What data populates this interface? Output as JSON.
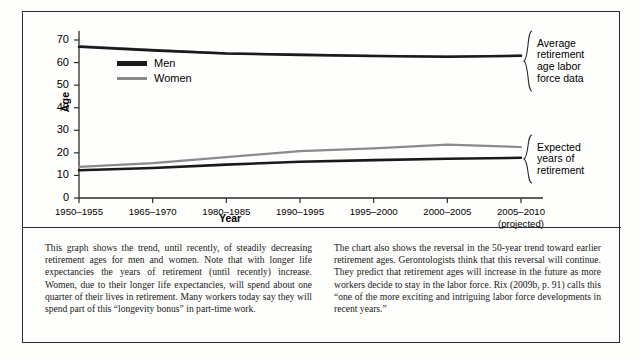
{
  "chart_data": {
    "type": "line",
    "title": "",
    "xlabel": "Year",
    "ylabel": "Age",
    "ylim": [
      0,
      70
    ],
    "ytick_step": 10,
    "grid": false,
    "legend_position": "upper-left-inside",
    "categories": [
      "1950–1955",
      "1965–1970",
      "1980–1985",
      "1990–1995",
      "1995–2000",
      "2000–2005",
      "2005–2010"
    ],
    "category_sublabels": [
      "",
      "",
      "",
      "",
      "",
      "",
      "(projected)"
    ],
    "yticks": [
      0,
      10,
      20,
      30,
      40,
      50,
      60,
      70
    ],
    "series": [
      {
        "name": "Men",
        "group": "Average retirement age labor force data",
        "color": "#1a1a1a",
        "values": [
          67.0,
          65.4,
          64.0,
          63.4,
          62.9,
          62.6,
          63.0
        ]
      },
      {
        "name": "Women",
        "group": "Average retirement age labor force data",
        "color": "#8a8a8a",
        "values": [
          67.3,
          65.6,
          64.1,
          63.5,
          63.0,
          62.7,
          63.1
        ]
      },
      {
        "name": "Men",
        "group": "Expected years of retirement",
        "color": "#1a1a1a",
        "values": [
          12.3,
          13.3,
          14.8,
          16.1,
          16.8,
          17.4,
          17.8
        ]
      },
      {
        "name": "Women",
        "group": "Expected years of retirement",
        "color": "#8a8a8a",
        "values": [
          13.8,
          15.4,
          18.1,
          20.8,
          22.0,
          23.6,
          22.6
        ]
      }
    ],
    "annotations": [
      {
        "id": "upper",
        "text": "Average\nretirement\nage labor\nforce data"
      },
      {
        "id": "lower",
        "text": "Expected\nyears of\nretirement"
      }
    ]
  },
  "legend": {
    "items": [
      {
        "label": "Men",
        "color": "#1a1a1a"
      },
      {
        "label": "Women",
        "color": "#8a8a8a"
      }
    ]
  },
  "axes": {
    "y_title": "Age",
    "x_title": "Year"
  },
  "caption": {
    "left": "This graph shows the trend, until recently, of steadily decreasing retirement ages for men and women. Note that with longer life expectancies the years of retirement (until recently) increase. Women, due to their longer life expectancies, will spend about one quarter of their lives in retirement. Many workers today say they will spend part of this “longevity bonus” in part-time work.",
    "right": "The chart also shows the reversal in the 50-year trend toward earlier retirement ages. Gerontologists think that this reversal will continue. They predict that retirement ages will increase in the future as more workers decide to stay in the labor force. Rix (2009b, p. 91) calls this “one of the more exciting and intriguing labor force developments in recent years.”"
  }
}
